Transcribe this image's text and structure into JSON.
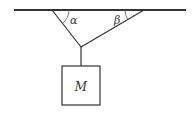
{
  "diagram": {
    "type": "physics-force-diagram",
    "angles": [
      {
        "symbol": "α",
        "location": "left rope / ceiling"
      },
      {
        "symbol": "β",
        "location": "right rope / ceiling"
      }
    ],
    "mass_label": "M",
    "colors": {
      "line": "#333333",
      "background": "#ffffff"
    }
  }
}
